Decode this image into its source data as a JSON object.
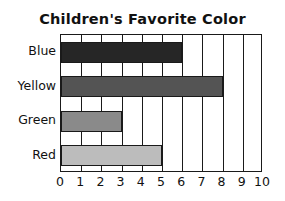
{
  "chart_data": {
    "type": "bar",
    "orientation": "horizontal",
    "title": "Children's Favorite Color",
    "xlabel": "",
    "ylabel": "",
    "categories": [
      "Blue",
      "Yellow",
      "Green",
      "Red"
    ],
    "values": [
      6,
      8,
      3,
      5
    ],
    "bar_colors": [
      "#262626",
      "#545454",
      "#8a8a8a",
      "#bcbcbc"
    ],
    "bar_outline_color": "#1a1a1a",
    "xlim": [
      0,
      10
    ],
    "xticks": [
      0,
      1,
      2,
      3,
      4,
      5,
      6,
      7,
      8,
      9,
      10
    ],
    "xtick_labels": [
      "0",
      "1",
      "2",
      "3",
      "4",
      "5",
      "6",
      "7",
      "8",
      "9",
      "10"
    ],
    "grid": "vertical",
    "legend": "none",
    "plot_border_color": "#1a1a1a",
    "background_color": "#ffffff"
  }
}
